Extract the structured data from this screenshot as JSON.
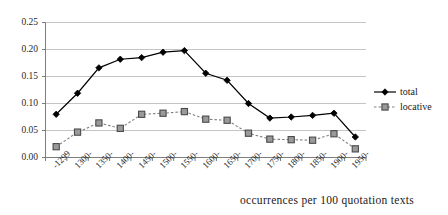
{
  "chart_data": {
    "type": "line",
    "title": "",
    "subtitle": "",
    "xlabel": "",
    "ylabel": "",
    "caption": "occurrences per 100 quotation texts",
    "categories": [
      "-1299",
      "1300-",
      "1350-",
      "1400-",
      "1450-",
      "1500-",
      "1550-",
      "1600-",
      "1650-",
      "1700-",
      "1750-",
      "1800-",
      "1850-",
      "1900-",
      "1950-"
    ],
    "series": [
      {
        "name": "total",
        "marker": "diamond",
        "line_style": "solid",
        "color": "#000000",
        "values": [
          0.08,
          0.119,
          0.166,
          0.182,
          0.185,
          0.195,
          0.198,
          0.156,
          0.143,
          0.1,
          0.073,
          0.075,
          0.078,
          0.082,
          0.038
        ]
      },
      {
        "name": "locative",
        "marker": "square",
        "line_style": "dashed",
        "color": "#808080",
        "values": [
          0.02,
          0.047,
          0.064,
          0.054,
          0.08,
          0.082,
          0.085,
          0.071,
          0.069,
          0.045,
          0.034,
          0.033,
          0.032,
          0.044,
          0.016
        ]
      }
    ],
    "yticks": [
      0.0,
      0.05,
      0.1,
      0.15,
      0.2,
      0.25
    ],
    "ytick_labels": [
      "0.00",
      "0.05",
      "0.10",
      "0.15",
      "0.20",
      "0.25"
    ],
    "ylim": [
      0.0,
      0.25
    ],
    "grid": "horizontal",
    "legend_position": "right",
    "legend": [
      "total",
      "locative"
    ]
  }
}
